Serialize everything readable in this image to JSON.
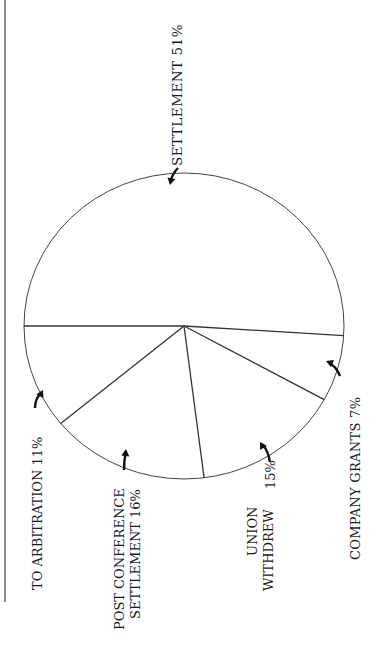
{
  "chart_data": {
    "type": "pie",
    "title": "",
    "orientation": "rotated 90° counter-clockwise (labels read bottom-to-top)",
    "slices": [
      {
        "label": "SETTLEMENT",
        "value": 51,
        "display": "SETTLEMENT  51%"
      },
      {
        "label": "COMPANY GRANTS",
        "value": 7,
        "display": "COMPANY GRANTS  7%"
      },
      {
        "label": "UNION WITHDREW",
        "value": 15,
        "display_lines": [
          "UNION",
          "WITHDREW"
        ],
        "value_label": "15%"
      },
      {
        "label": "POST CONFERENCE SETTLEMENT",
        "value": 16,
        "display_lines": [
          "POST CONFERENCE",
          "SETTLEMENT  16%"
        ]
      },
      {
        "label": "TO ARBITRATION",
        "value": 11,
        "display": "TO ARBITRATION  11%"
      }
    ],
    "legend": "none (labels with arrows pointing to slices)",
    "colors": {
      "outline": "#333333",
      "text": "#1a1a1a",
      "background": "#ffffff"
    }
  }
}
